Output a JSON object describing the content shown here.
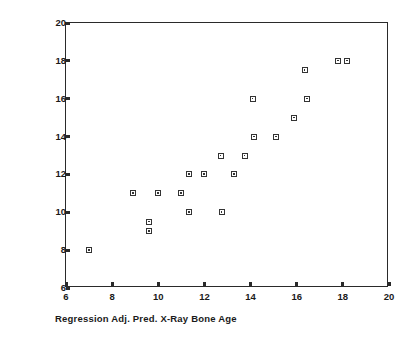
{
  "chart_data": {
    "type": "scatter",
    "title": "",
    "xlabel": "Regression Adj. Pred. X-Ray Bone Age",
    "ylabel": "Observed X-Ray Bone Age",
    "xlim": [
      6,
      20
    ],
    "ylim": [
      6,
      20
    ],
    "xticks": [
      6,
      8,
      10,
      12,
      14,
      16,
      18,
      20
    ],
    "yticks": [
      6,
      8,
      10,
      12,
      14,
      16,
      18,
      20
    ],
    "xtick_labels": [
      "6",
      "8",
      "10",
      "12",
      "14",
      "16",
      "18",
      "20"
    ],
    "ytick_labels": [
      "6",
      "8",
      "10",
      "12",
      "14",
      "16",
      "18",
      "20"
    ],
    "grid": false,
    "legend": null,
    "marker": "open-square",
    "points": [
      {
        "x": 7.0,
        "y": 8.0
      },
      {
        "x": 8.9,
        "y": 11.0
      },
      {
        "x": 9.6,
        "y": 9.5
      },
      {
        "x": 9.6,
        "y": 9.0
      },
      {
        "x": 10.0,
        "y": 11.0
      },
      {
        "x": 11.0,
        "y": 11.0
      },
      {
        "x": 11.35,
        "y": 12.0
      },
      {
        "x": 11.35,
        "y": 10.0
      },
      {
        "x": 12.0,
        "y": 12.0
      },
      {
        "x": 12.7,
        "y": 13.0
      },
      {
        "x": 12.75,
        "y": 10.0
      },
      {
        "x": 13.3,
        "y": 12.0
      },
      {
        "x": 13.75,
        "y": 13.0
      },
      {
        "x": 14.1,
        "y": 16.0
      },
      {
        "x": 14.15,
        "y": 14.0
      },
      {
        "x": 15.1,
        "y": 14.0
      },
      {
        "x": 15.9,
        "y": 15.0
      },
      {
        "x": 16.35,
        "y": 17.5
      },
      {
        "x": 16.45,
        "y": 16.0
      },
      {
        "x": 17.8,
        "y": 18.0
      },
      {
        "x": 18.2,
        "y": 18.0
      }
    ]
  }
}
